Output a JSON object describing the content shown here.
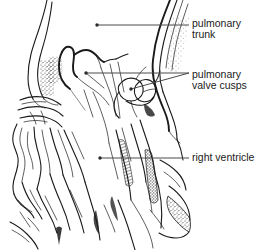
{
  "figure": {
    "background_color": "#ffffff",
    "ink_color": "#1a1a1a",
    "leader_color": "#4a4a4a",
    "labels": [
      {
        "id": "pulmonary-trunk",
        "lines": [
          "pulmonary",
          "trunk"
        ],
        "text_x": 192,
        "line1_y": 27,
        "line2_y": 38,
        "leader": {
          "x1": 97,
          "y1": 25,
          "x2": 189,
          "y2": 25
        },
        "dot": {
          "cx": 97,
          "cy": 25,
          "r": 1.7
        }
      },
      {
        "id": "pulmonary-valve-cusps",
        "lines": [
          "pulmonary",
          "valve cusps"
        ],
        "text_x": 192,
        "line1_y": 78,
        "line2_y": 89,
        "leader": {
          "x1": 86,
          "y1": 73,
          "x2": 189,
          "y2": 73
        },
        "dot": {
          "cx": 86,
          "cy": 73,
          "r": 1.7
        },
        "branch": {
          "x1": 189,
          "y1": 73,
          "x2": 131,
          "y2": 89
        },
        "branch_dot": {
          "cx": 131,
          "cy": 89,
          "r": 1.7
        }
      },
      {
        "id": "right-ventricle",
        "lines": [
          "right ventricle"
        ],
        "text_x": 192,
        "line1_y": 161,
        "leader": {
          "x1": 100,
          "y1": 158,
          "x2": 189,
          "y2": 158
        },
        "dot": {
          "cx": 100,
          "cy": 158,
          "r": 1.7
        }
      }
    ]
  }
}
